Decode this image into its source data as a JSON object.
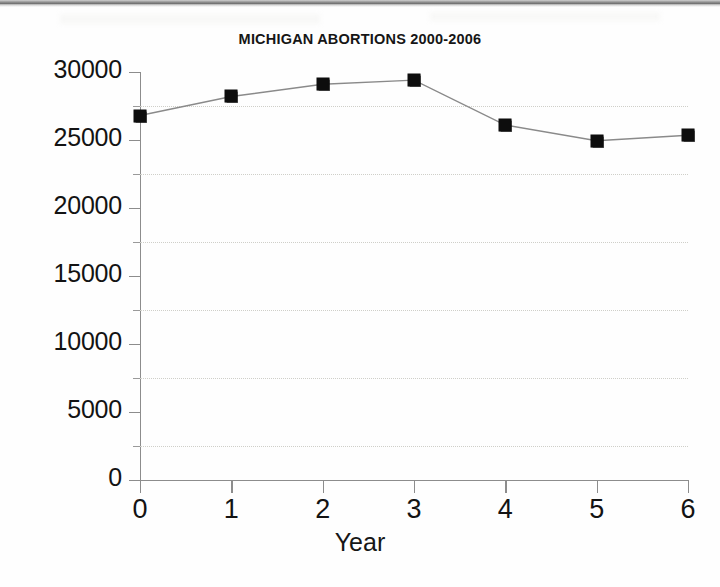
{
  "page": {
    "background_color": "#fefefe"
  },
  "chart_data": {
    "type": "line",
    "title": "MICHIGAN ABORTIONS 2000-2006",
    "xlabel": "Year",
    "ylabel": "",
    "x": [
      0,
      1,
      2,
      3,
      4,
      5,
      6
    ],
    "categories": [
      "0",
      "1",
      "2",
      "3",
      "4",
      "5",
      "6"
    ],
    "values": [
      26800,
      28200,
      29100,
      29400,
      26100,
      24950,
      25350
    ],
    "series": [
      {
        "name": "Abortions",
        "values": [
          26800,
          28200,
          29100,
          29400,
          26100,
          24950,
          25350
        ]
      }
    ],
    "xlim": [
      0,
      6
    ],
    "ylim": [
      0,
      30000
    ],
    "y_major_ticks": [
      0,
      5000,
      10000,
      15000,
      20000,
      25000,
      30000
    ],
    "y_tick_labels": [
      "0",
      "5000",
      "10000",
      "15000",
      "20000",
      "25000",
      "30000"
    ],
    "y_minor_ticks": [
      2500,
      7500,
      12500,
      17500,
      22500,
      27500
    ],
    "x_tick_labels": [
      "0",
      "1",
      "2",
      "3",
      "4",
      "5",
      "6"
    ],
    "grid": "horizontal-dotted-minor",
    "legend": "none",
    "marker_style": "filled-square",
    "marker_color": "#0d0d0d",
    "line_color": "#8a8a8a",
    "axis_color": "#8c8c8c",
    "gridline_color": "#cfcfc9",
    "text_color": "#131313"
  }
}
